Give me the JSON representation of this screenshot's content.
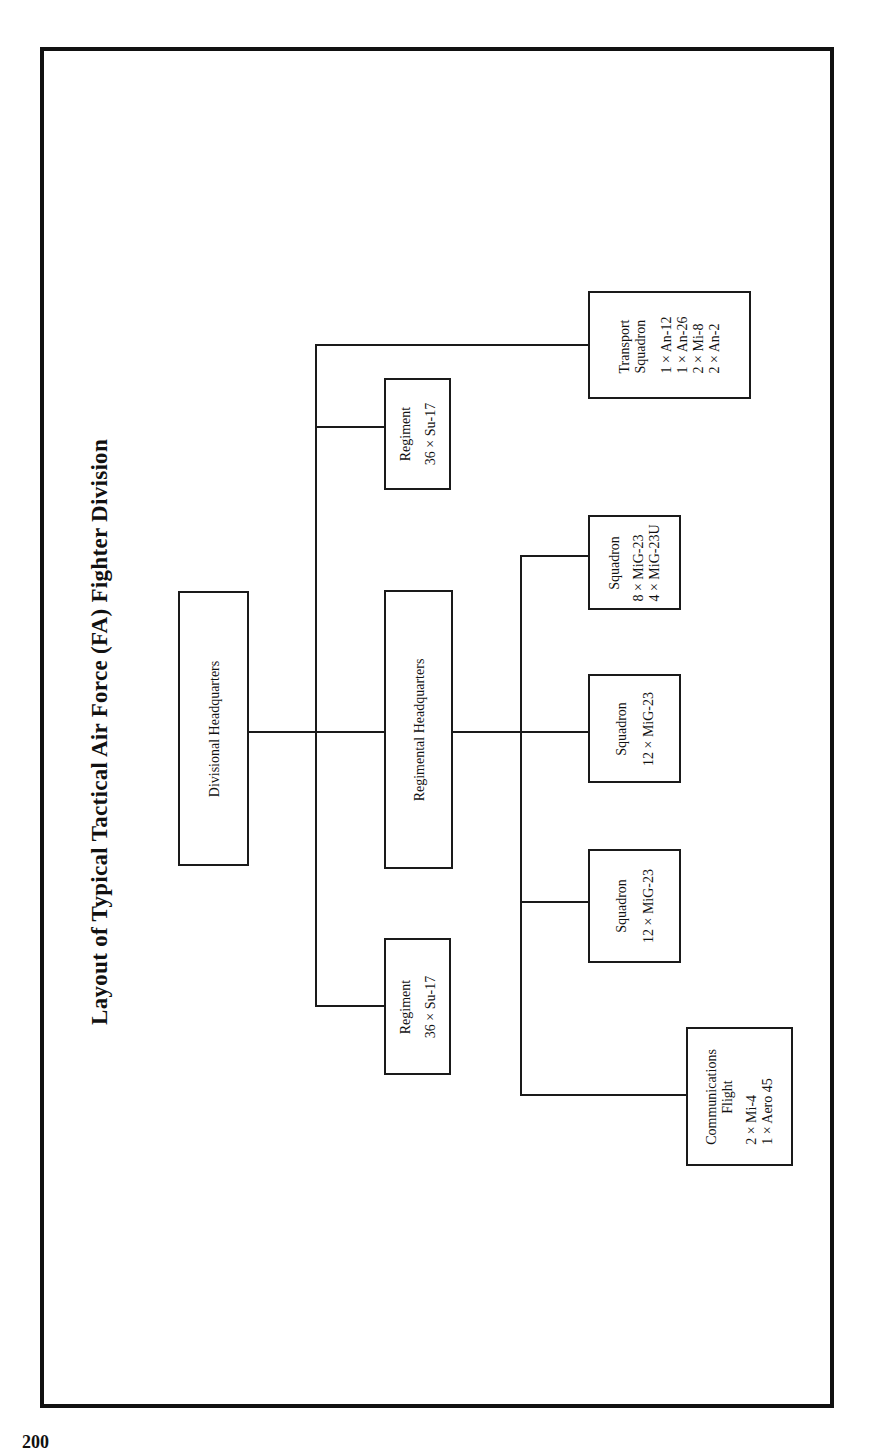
{
  "title": "Layout of Typical Tactical Air Force (FA) Fighter Division",
  "page_number": "200",
  "nodes": {
    "divisional_hq": {
      "label": "Divisional Headquarters"
    },
    "regimental_hq": {
      "label": "Regimental Headquarters"
    },
    "regiment_1": {
      "label": "Regiment",
      "aircraft": [
        "36 × Su-17"
      ]
    },
    "regiment_2": {
      "label": "Regiment",
      "aircraft": [
        "36 × Su-17"
      ]
    },
    "transport_squadron": {
      "label": "Transport Squadron",
      "label_lines": [
        "Transport",
        "Squadron"
      ],
      "aircraft": [
        "1 × An-12",
        "1 × An-26",
        "2 × Mi-8",
        "2 × An-2"
      ]
    },
    "squadron_1": {
      "label": "Squadron",
      "aircraft": [
        "8 × MiG-23",
        "4 × MiG-23U"
      ]
    },
    "squadron_2": {
      "label": "Squadron",
      "aircraft": [
        "12 × MiG-23"
      ]
    },
    "squadron_3": {
      "label": "Squadron",
      "aircraft": [
        "12 × MiG-23"
      ]
    },
    "communications_flight": {
      "label": "Communications Flight",
      "label_lines": [
        "Communications",
        "Flight"
      ],
      "aircraft": [
        "2 × Mi-4",
        "1 × Aero 45"
      ]
    }
  },
  "edges": [
    [
      "divisional_hq",
      "regimental_hq"
    ],
    [
      "divisional_hq",
      "regiment_1"
    ],
    [
      "divisional_hq",
      "regiment_2"
    ],
    [
      "divisional_hq",
      "transport_squadron"
    ],
    [
      "regimental_hq",
      "squadron_1"
    ],
    [
      "regimental_hq",
      "squadron_2"
    ],
    [
      "regimental_hq",
      "squadron_3"
    ],
    [
      "regimental_hq",
      "communications_flight"
    ]
  ]
}
